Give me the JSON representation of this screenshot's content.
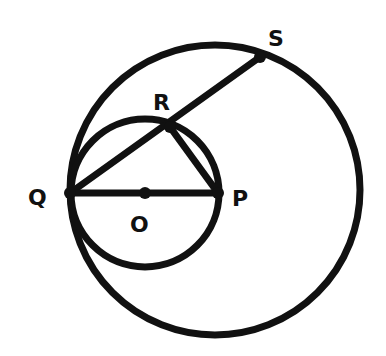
{
  "diagram": {
    "type": "geometry",
    "stroke_color": "#111111",
    "background": "#ffffff",
    "points": {
      "Q": {
        "label": "Q",
        "x": 70,
        "y": 193
      },
      "P": {
        "label": "P",
        "x": 218,
        "y": 193
      },
      "O": {
        "label": "O",
        "x": 145,
        "y": 193
      },
      "R": {
        "label": "R",
        "x": 170,
        "y": 127
      },
      "S": {
        "label": "S",
        "x": 260,
        "y": 57
      }
    },
    "circles": [
      {
        "name": "large-circle",
        "cx": 215,
        "cy": 190,
        "r": 145
      },
      {
        "name": "small-circle",
        "center": "O",
        "cx": 145,
        "cy": 193,
        "r": 74
      }
    ],
    "segments": [
      {
        "from": "Q",
        "to": "S"
      },
      {
        "from": "Q",
        "to": "P"
      },
      {
        "from": "R",
        "to": "P"
      }
    ]
  }
}
